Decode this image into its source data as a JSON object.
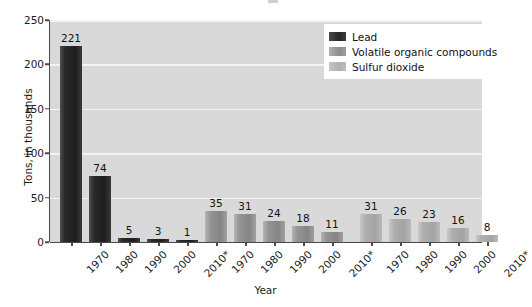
{
  "chart_data": {
    "type": "bar",
    "title": "",
    "xlabel": "Year",
    "ylabel": "Tons, in thousands",
    "ylim": [
      0,
      250
    ],
    "yticks": [
      0,
      50,
      100,
      150,
      200,
      250
    ],
    "grid": true,
    "legend_position": "top-right",
    "categories": [
      "1970",
      "1980",
      "1990",
      "2000",
      "2010*"
    ],
    "series": [
      {
        "name": "Lead",
        "color": "#262626",
        "values": [
          221,
          74,
          5,
          3,
          1
        ]
      },
      {
        "name": "Volatile organic compounds",
        "color": "#8e8e8e",
        "values": [
          35,
          31,
          24,
          18,
          11
        ]
      },
      {
        "name": "Sulfur dioxide",
        "color": "#b0b0b0",
        "values": [
          31,
          26,
          23,
          16,
          8
        ]
      }
    ]
  },
  "axes": {
    "y_label": "Tons, in thousands",
    "x_label": "Year",
    "y_ticks": [
      "0",
      "50",
      "100",
      "150",
      "200",
      "250"
    ]
  },
  "legend": {
    "items": [
      {
        "label": "Lead",
        "swatch": "lead"
      },
      {
        "label": "Volatile organic compounds",
        "swatch": "voc"
      },
      {
        "label": "Sulfur dioxide",
        "swatch": "so2"
      }
    ]
  },
  "groups": [
    {
      "series": "Lead",
      "swatch": "lead",
      "bars": [
        {
          "year": "1970",
          "value": "221"
        },
        {
          "year": "1980",
          "value": "74"
        },
        {
          "year": "1990",
          "value": "5"
        },
        {
          "year": "2000",
          "value": "3"
        },
        {
          "year": "2010*",
          "value": "1"
        }
      ]
    },
    {
      "series": "Volatile organic compounds",
      "swatch": "voc",
      "bars": [
        {
          "year": "1970",
          "value": "35"
        },
        {
          "year": "1980",
          "value": "31"
        },
        {
          "year": "1990",
          "value": "24"
        },
        {
          "year": "2000",
          "value": "18"
        },
        {
          "year": "2010*",
          "value": "11"
        }
      ]
    },
    {
      "series": "Sulfur dioxide",
      "swatch": "so2",
      "bars": [
        {
          "year": "1970",
          "value": "31"
        },
        {
          "year": "1980",
          "value": "26"
        },
        {
          "year": "1990",
          "value": "23"
        },
        {
          "year": "2000",
          "value": "16"
        },
        {
          "year": "2010*",
          "value": "8"
        }
      ]
    }
  ]
}
